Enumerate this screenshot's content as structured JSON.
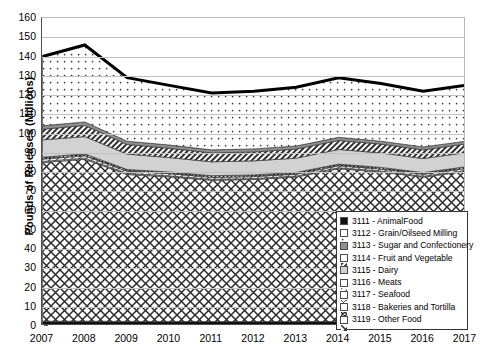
{
  "chart_data": {
    "type": "area",
    "title": "",
    "xlabel": "",
    "ylabel": "Pounds of Releases (Millions)",
    "categories": [
      2007,
      2008,
      2009,
      2010,
      2011,
      2012,
      2013,
      2014,
      2015,
      2016,
      2017
    ],
    "x_tick_labels": [
      "2007",
      "2008",
      "2009",
      "2010",
      "2011",
      "2012",
      "2013",
      "2014",
      "2015",
      "2016",
      "2017"
    ],
    "y_tick_labels": [
      "0",
      "10",
      "20",
      "30",
      "40",
      "50",
      "60",
      "70",
      "80",
      "90",
      "100",
      "110",
      "120",
      "130",
      "140",
      "150",
      "160"
    ],
    "ylim": [
      0,
      160
    ],
    "y_step": 10,
    "grid": true,
    "stacked": true,
    "legend_position": "inside-bottom-right",
    "series": [
      {
        "name": "3111 - AnimalFood",
        "code": "3111",
        "label": "AnimalFood",
        "pattern": "solid-black",
        "color": "#111111",
        "values": [
          2.5,
          2.5,
          2.4,
          2.4,
          2.3,
          2.3,
          2.3,
          2.4,
          2.3,
          2.3,
          2.4
        ]
      },
      {
        "name": "3112 - Grain/Oilseed Milling",
        "code": "3112",
        "label": "Grain/Oilseed Milling",
        "pattern": "sparse-dots",
        "color": "#fdfdfd",
        "values": [
          36.0,
          40.0,
          33.0,
          31.0,
          29.5,
          30.0,
          30.5,
          31.0,
          30.0,
          29.0,
          29.0
        ]
      },
      {
        "name": "3113 - Sugar and Confectionery",
        "code": "3113",
        "label": "Sugar and Confectionery",
        "pattern": "solid-gray",
        "color": "#8f8f8f",
        "values": [
          1.8,
          1.8,
          1.7,
          1.7,
          1.6,
          1.6,
          1.6,
          1.6,
          1.5,
          1.5,
          1.5
        ]
      },
      {
        "name": "3114 - Fruit and Vegetable",
        "code": "3114",
        "label": "Fruit and Vegetable",
        "pattern": "fine-hatch",
        "color": "#5a5a5a",
        "values": [
          5.5,
          5.8,
          5.0,
          4.8,
          4.6,
          4.6,
          4.7,
          4.7,
          4.6,
          4.5,
          4.5
        ]
      },
      {
        "name": "3115 - Dairy",
        "code": "3115",
        "label": "Dairy",
        "pattern": "light-gray",
        "color": "#d2d2d2",
        "values": [
          9.0,
          9.0,
          8.0,
          7.5,
          7.2,
          7.3,
          7.4,
          7.6,
          7.5,
          7.3,
          7.3
        ]
      },
      {
        "name": "3116 - Meats",
        "code": "3116",
        "label": "Meats",
        "pattern": "diag-thin",
        "color": "#efefef",
        "values": [
          1.2,
          1.2,
          1.1,
          1.1,
          1.0,
          1.0,
          1.0,
          1.0,
          1.0,
          1.0,
          1.0
        ]
      },
      {
        "name": "3117 - Seafood",
        "code": "3117",
        "label": "Seafood",
        "pattern": "cross-thin",
        "color": "#f5f5f5",
        "values": [
          0.6,
          0.6,
          0.6,
          0.5,
          0.5,
          0.5,
          0.5,
          0.5,
          0.5,
          0.5,
          0.5
        ]
      },
      {
        "name": "3118 - Bakeries and Tortilla",
        "code": "3118",
        "label": "Bakeries and Tortilla",
        "pattern": "dense-cross",
        "color": "#b9b9b9",
        "values": [
          1.0,
          1.0,
          0.9,
          0.9,
          0.9,
          0.9,
          0.9,
          0.9,
          0.9,
          0.9,
          0.9
        ]
      },
      {
        "name": "3119 - Other Food",
        "code": "3119",
        "label": "Other Food",
        "pattern": "wide-diamond",
        "color": "#fafafa",
        "values": [
          82.4,
          84.1,
          76.3,
          75.1,
          73.4,
          73.8,
          75.1,
          79.3,
          77.7,
          75.0,
          77.9
        ]
      }
    ],
    "totals": [
      140.0,
      146.0,
      129.0,
      125.0,
      121.0,
      122.0,
      124.0,
      129.0,
      126.0,
      122.0,
      125.0
    ],
    "total_line": {
      "name": "Total releases outline",
      "color": "#000000",
      "width": 3
    }
  },
  "legend": {
    "items": [
      {
        "label": "3111 - AnimalFood"
      },
      {
        "label": "3112 - Grain/Oilseed Milling"
      },
      {
        "label": "3113 - Sugar and Confectionery"
      },
      {
        "label": "3114 - Fruit and Vegetable"
      },
      {
        "label": "3115 - Dairy"
      },
      {
        "label": "3116 - Meats"
      },
      {
        "label": "3117 - Seafood"
      },
      {
        "label": "3118 - Bakeries and Tortilla"
      },
      {
        "label": "3119 - Other Food"
      }
    ]
  }
}
